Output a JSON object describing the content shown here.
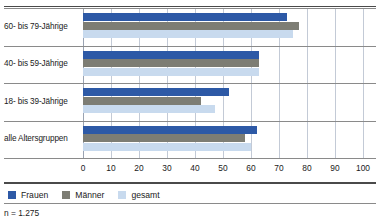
{
  "chart_data": {
    "type": "bar",
    "orientation": "horizontal",
    "title": "",
    "xlabel": "",
    "ylabel": "",
    "xlim": [
      0,
      100
    ],
    "xticks": [
      0,
      10,
      20,
      30,
      40,
      50,
      60,
      70,
      80,
      90,
      100
    ],
    "xtick_labels": [
      "0",
      "10",
      "20",
      "30",
      "40",
      "50",
      "60",
      "70",
      "80",
      "90",
      "100"
    ],
    "grid": true,
    "grid_axis": "x",
    "legend_position": "bottom-left",
    "categories": [
      "60- bis 79-Jährige",
      "40- bis 59-Jährige",
      "18- bis 39-Jährige",
      "alle Altersgruppen"
    ],
    "series": [
      {
        "name": "Frauen",
        "color": "#2d59a6",
        "values": [
          73,
          63,
          52,
          62
        ]
      },
      {
        "name": "Männer",
        "color": "#7d7d74",
        "values": [
          77,
          63,
          42,
          58
        ]
      },
      {
        "name": "gesamt",
        "color": "#c8daee",
        "values": [
          75,
          63,
          47,
          60
        ]
      }
    ],
    "footnote": "n = 1.275"
  },
  "legend": {
    "items": [
      {
        "label": "Frauen"
      },
      {
        "label": "Männer"
      },
      {
        "label": "gesamt"
      }
    ]
  },
  "footer": {
    "sample_size": "n = 1.275"
  }
}
